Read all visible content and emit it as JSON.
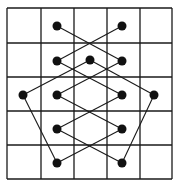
{
  "diagram": {
    "type": "grid-graph",
    "grid": {
      "columns": 5,
      "rows": 5,
      "x_lines": [
        7,
        41,
        74,
        107,
        140,
        172
      ],
      "y_lines": [
        8,
        43,
        77,
        111,
        145,
        179
      ],
      "line_color": "#1a1a1a"
    },
    "nodes": [
      {
        "id": "n1",
        "x": 57,
        "y": 26
      },
      {
        "id": "n2",
        "x": 122,
        "y": 26
      },
      {
        "id": "n3",
        "x": 57,
        "y": 61
      },
      {
        "id": "n4",
        "x": 90,
        "y": 60
      },
      {
        "id": "n5",
        "x": 122,
        "y": 61
      },
      {
        "id": "n6",
        "x": 23,
        "y": 95
      },
      {
        "id": "n7",
        "x": 57,
        "y": 95
      },
      {
        "id": "n8",
        "x": 122,
        "y": 95
      },
      {
        "id": "n9",
        "x": 154,
        "y": 95
      },
      {
        "id": "n10",
        "x": 57,
        "y": 129
      },
      {
        "id": "n11",
        "x": 122,
        "y": 129
      },
      {
        "id": "n12",
        "x": 57,
        "y": 163
      },
      {
        "id": "n13",
        "x": 122,
        "y": 163
      }
    ],
    "edges": [
      [
        "n1",
        "n5"
      ],
      [
        "n2",
        "n3"
      ],
      [
        "n3",
        "n8"
      ],
      [
        "n5",
        "n7"
      ],
      [
        "n4",
        "n6"
      ],
      [
        "n4",
        "n9"
      ],
      [
        "n7",
        "n11"
      ],
      [
        "n8",
        "n10"
      ],
      [
        "n10",
        "n13"
      ],
      [
        "n11",
        "n12"
      ],
      [
        "n6",
        "n12"
      ],
      [
        "n9",
        "n13"
      ]
    ],
    "node_color": "#111111",
    "node_radius": 4.5,
    "edge_color": "#1a1a1a"
  }
}
